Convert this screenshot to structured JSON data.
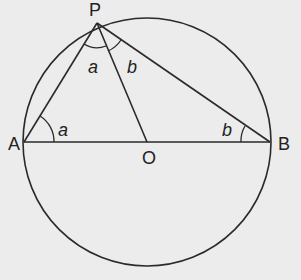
{
  "diagram": {
    "points": {
      "P": {
        "label": "P",
        "x": 97,
        "y": 23
      },
      "A": {
        "label": "A",
        "x": 24,
        "y": 142
      },
      "B": {
        "label": "B",
        "x": 270,
        "y": 142
      },
      "O": {
        "label": "O",
        "x": 147,
        "y": 142
      }
    },
    "circle": {
      "cx": 147,
      "cy": 142,
      "r": 124
    },
    "angle_labels": {
      "at_A": "a",
      "at_P_left": "a",
      "at_P_right": "b",
      "at_B": "b"
    },
    "colors": {
      "line": "#2a2a2a",
      "background": "#ececec"
    }
  }
}
